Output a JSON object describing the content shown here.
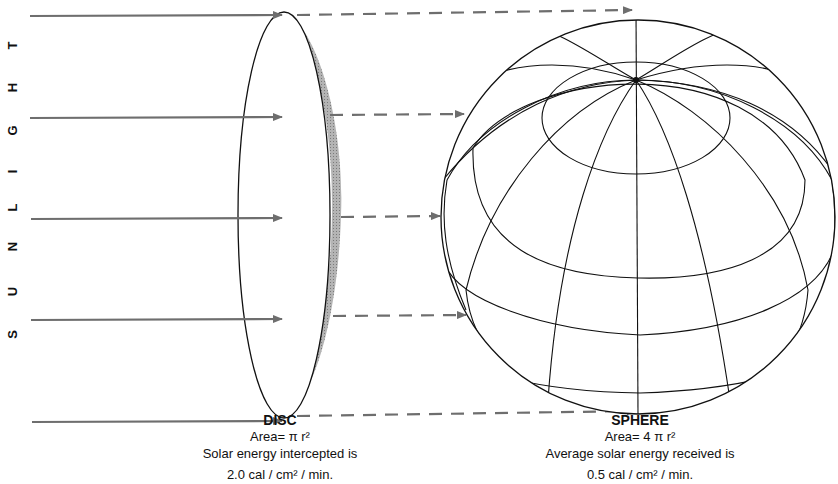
{
  "sunlight_label": {
    "letters": [
      "S",
      "U",
      "N",
      "L",
      "I",
      "G",
      "H",
      "T"
    ],
    "text": "SUNLIGHT"
  },
  "disc": {
    "title": "DISC",
    "area": "Area= π r²",
    "description": "Solar energy intercepted is",
    "value": "2.0 cal / cm² / min."
  },
  "sphere": {
    "title": "SPHERE",
    "area": "Area= 4 π r²",
    "description": "Average solar energy received is",
    "value": "0.5 cal / cm² / min."
  },
  "colors": {
    "arrow": "#6e6e6e",
    "line": "#111111",
    "shade": "#9a9a9a",
    "background": "#ffffff"
  }
}
